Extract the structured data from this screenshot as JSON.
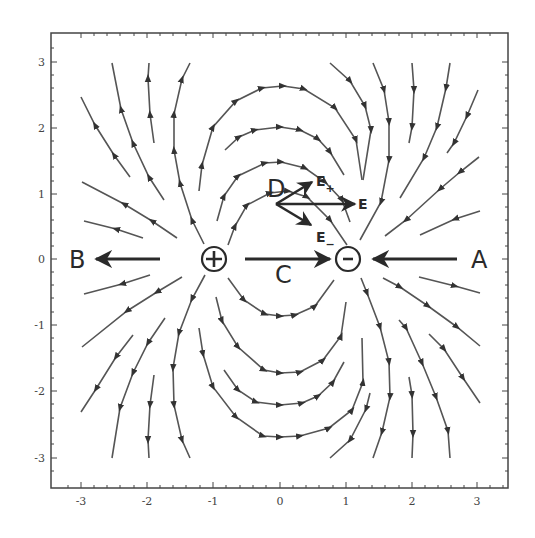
{
  "diagram": {
    "type": "electric field lines of a dipole",
    "colors": {
      "lines": "#555555",
      "arrows": "#2a2a2a",
      "frame": "#444444",
      "background": "#ffffff"
    },
    "axes": {
      "x_ticks": [
        "-3",
        "-2",
        "-1",
        "0",
        "1",
        "2",
        "3"
      ],
      "y_ticks": [
        "3",
        "2",
        "1",
        "0",
        "-1",
        "-2",
        "-3"
      ],
      "xlim": [
        -3.4,
        3.4
      ],
      "ylim": [
        -3.4,
        3.4
      ]
    },
    "charges": {
      "positive": {
        "symbol": "+",
        "x": -1,
        "y": 0
      },
      "negative": {
        "symbol": "−",
        "x": 1,
        "y": 0
      }
    },
    "points": {
      "A": "A",
      "B": "B",
      "C": "C",
      "D": "D"
    },
    "vectors": {
      "e_plus": {
        "base": "E",
        "sub": "+"
      },
      "e_total": {
        "base": "E"
      },
      "e_minus": {
        "base": "E",
        "sub": "−"
      }
    }
  }
}
